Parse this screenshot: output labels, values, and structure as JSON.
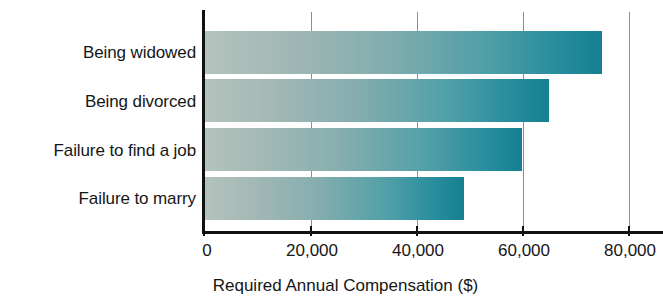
{
  "chart_data": {
    "type": "bar",
    "orientation": "horizontal",
    "title": "",
    "subtitle": "",
    "xlabel": "Required Annual Compensation ($)",
    "ylabel": "",
    "categories": [
      "Being widowed",
      "Being divorced",
      "Failure to find a job",
      "Failure to marry"
    ],
    "values": [
      75000,
      65000,
      60000,
      49000
    ],
    "series": [
      {
        "name": "Required Annual Compensation",
        "values": [
          75000,
          65000,
          60000,
          49000
        ]
      }
    ],
    "xlim": [
      0,
      86000
    ],
    "xticks": [
      0,
      20000,
      40000,
      60000,
      80000
    ],
    "xtick_labels": [
      "0",
      "20,000",
      "40,000",
      "60,000",
      "80,000"
    ],
    "grid": "vertical-only",
    "legend": "none",
    "bar_gradient_start": "#b3c3bd",
    "bar_gradient_end": "#15808f",
    "axis_color": "#111111",
    "gridline_color": "#8d8d8d",
    "background": "#ffffff"
  }
}
